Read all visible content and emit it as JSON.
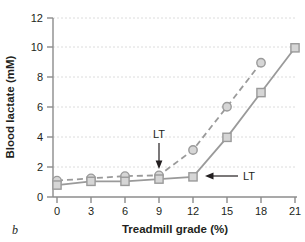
{
  "figure": {
    "panel_label": "b"
  },
  "chart_data": {
    "type": "line",
    "title": "",
    "xlabel": "Treadmill grade (%)",
    "ylabel": "Blood lactate (mM)",
    "xlim": [
      0,
      21
    ],
    "ylim": [
      0,
      12
    ],
    "xticks": [
      0,
      3,
      6,
      9,
      12,
      15,
      18,
      21
    ],
    "yticks": [
      0,
      2,
      4,
      6,
      8,
      10,
      12
    ],
    "xtick_labels": [
      "0",
      "3",
      "6",
      "9",
      "12",
      "15",
      "18",
      "21"
    ],
    "ytick_labels": [
      "0",
      "2",
      "4",
      "6",
      "8",
      "10",
      "12"
    ],
    "grid": "horizontal-dashed",
    "legend": "none",
    "series": [
      {
        "name": "untrained",
        "marker": "circle",
        "linestyle": "dashed",
        "color": "#9a9a9a",
        "marker_fill": "#d6d6d6",
        "x": [
          0,
          3,
          6,
          9,
          12,
          15,
          18
        ],
        "values": [
          1.1,
          1.25,
          1.4,
          1.45,
          3.15,
          6.05,
          9.0
        ]
      },
      {
        "name": "trained",
        "marker": "square",
        "linestyle": "solid",
        "color": "#9a9a9a",
        "marker_fill": "#d6d6d6",
        "x": [
          0,
          3,
          6,
          9,
          12,
          15,
          18,
          21
        ],
        "values": [
          0.8,
          1.05,
          1.05,
          1.2,
          1.35,
          4.0,
          7.0,
          10.0
        ]
      }
    ],
    "annotations": [
      {
        "text": "LT",
        "arrow": "down",
        "target_series": "untrained",
        "target_x": 9,
        "target_y": 1.45
      },
      {
        "text": "LT",
        "arrow": "left",
        "target_series": "trained",
        "target_x": 12,
        "target_y": 1.35
      }
    ]
  }
}
